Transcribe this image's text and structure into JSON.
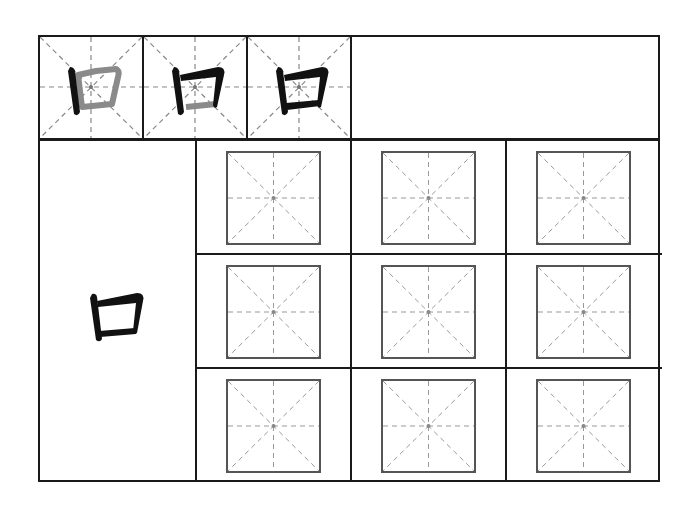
{
  "worksheet": {
    "character": "口",
    "stroke_order_steps": [
      {
        "step": 1,
        "label": "stroke 1 of 3",
        "highlight": "first"
      },
      {
        "step": 2,
        "label": "stroke 2 of 3",
        "highlight": "second"
      },
      {
        "step": 3,
        "label": "stroke 3 of 3",
        "highlight": "complete"
      }
    ],
    "practice_grid": {
      "rows": 3,
      "columns": 3,
      "cell_type": "mizi-ge"
    },
    "colors": {
      "ink": "#111111",
      "ghost_stroke": "#8a8a8a",
      "guide_line": "#9a9a9a",
      "border": "#1a1a1a"
    }
  }
}
